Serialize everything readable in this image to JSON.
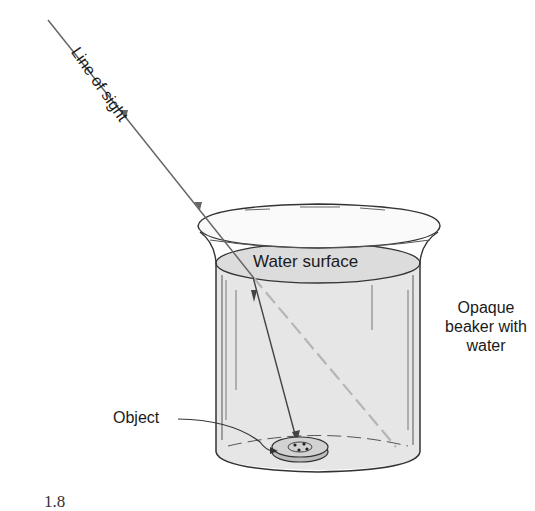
{
  "diagram": {
    "labels": {
      "line_of_sight": "Line of sight",
      "water_surface": "Water surface",
      "beaker_line1": "Opaque",
      "beaker_line2": "beaker with",
      "beaker_line3": "water",
      "object": "Object"
    },
    "figure_number": "1.8",
    "colors": {
      "water": "#e4e4e4",
      "line": "#333333",
      "ray": "#666666",
      "dashed_ray": "#b5b5b5"
    }
  }
}
